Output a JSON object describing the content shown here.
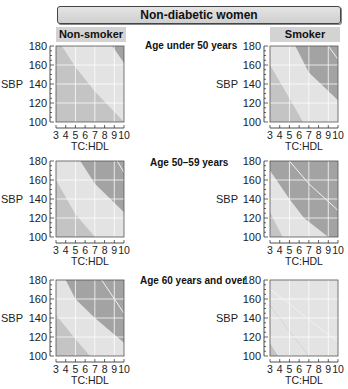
{
  "title": "Non-diabetic women",
  "columns": [
    {
      "label": "Non-smoker"
    },
    {
      "label": "Smoker"
    }
  ],
  "rows": [
    {
      "label": "Age under 50 years"
    },
    {
      "label": "Age  50–59 years"
    },
    {
      "label": "Age 60 years and over"
    }
  ],
  "axes": {
    "ylabel": "SBP",
    "xlabel": "TC:HDL",
    "yticks": [
      "180",
      "160",
      "140",
      "120",
      "100"
    ],
    "xticks": [
      "3",
      "4",
      "5",
      "6",
      "7",
      "8",
      "9",
      "10"
    ]
  },
  "colors": {
    "light": "#e3e3e3",
    "medium": "#c4c4c4",
    "dark": "#a3a3a3",
    "line": "#f2f2f2",
    "tag": "#d3d3d3"
  },
  "chart_data": [
    {
      "type": "area",
      "title": "Non-smoker, Age under 50 years",
      "xlabel": "TC:HDL",
      "ylabel": "SBP",
      "xlim": [
        3,
        10
      ],
      "ylim": [
        100,
        180
      ],
      "zones": [
        {
          "name": "medium",
          "region": "left of curve"
        },
        {
          "name": "light",
          "boundary": [
            [
              3.6,
              180
            ],
            [
              5,
              158
            ],
            [
              7,
              132
            ],
            [
              10,
              100
            ]
          ]
        },
        {
          "name": "dark",
          "boundary": [
            [
              8.8,
              180
            ],
            [
              10,
              162
            ]
          ]
        }
      ]
    },
    {
      "type": "area",
      "title": "Smoker, Age under 50 years",
      "xlabel": "TC:HDL",
      "ylabel": "SBP",
      "xlim": [
        3,
        10
      ],
      "ylim": [
        100,
        180
      ],
      "zones": [
        {
          "name": "medium",
          "region": "lower-left"
        },
        {
          "name": "light",
          "boundary": [
            [
              3,
              160
            ],
            [
              5,
              125
            ],
            [
              6.4,
              100
            ]
          ]
        },
        {
          "name": "dark",
          "boundary": [
            [
              5.6,
              180
            ],
            [
              7,
              152
            ],
            [
              10,
              123
            ]
          ]
        },
        {
          "name": "line",
          "boundary": [
            [
              9,
              180
            ],
            [
              10,
              166
            ]
          ]
        }
      ]
    },
    {
      "type": "area",
      "title": "Non-smoker, Age 50–59 years",
      "xlabel": "TC:HDL",
      "ylabel": "SBP",
      "xlim": [
        3,
        10
      ],
      "ylim": [
        100,
        180
      ],
      "zones": [
        {
          "name": "medium",
          "region": "lower-left"
        },
        {
          "name": "light",
          "boundary": [
            [
              3,
              160
            ],
            [
              5,
              124
            ],
            [
              7,
              100
            ]
          ]
        },
        {
          "name": "dark",
          "boundary": [
            [
              5.5,
              180
            ],
            [
              7,
              156
            ],
            [
              10,
              126
            ]
          ]
        },
        {
          "name": "line",
          "boundary": [
            [
              9.3,
              180
            ],
            [
              10,
              168
            ]
          ]
        }
      ]
    },
    {
      "type": "area",
      "title": "Smoker, Age 50–59 years",
      "xlabel": "TC:HDL",
      "ylabel": "SBP",
      "xlim": [
        3,
        10
      ],
      "ylim": [
        100,
        180
      ],
      "zones": [
        {
          "name": "medium",
          "region": "lower-left corner"
        },
        {
          "name": "light",
          "boundary": [
            [
              3,
              126
            ],
            [
              4.3,
              100
            ]
          ]
        },
        {
          "name": "dark",
          "boundary": [
            [
              3,
              170
            ],
            [
              5,
              140
            ],
            [
              6.5,
              120
            ],
            [
              9,
              100
            ]
          ]
        },
        {
          "name": "line",
          "boundary": [
            [
              5,
              180
            ],
            [
              7,
              156
            ],
            [
              10,
              128
            ]
          ]
        }
      ]
    },
    {
      "type": "area",
      "title": "Non-smoker, Age 60 years and over",
      "xlabel": "TC:HDL",
      "ylabel": "SBP",
      "xlim": [
        3,
        10
      ],
      "ylim": [
        100,
        180
      ],
      "zones": [
        {
          "name": "medium",
          "region": "lower-left"
        },
        {
          "name": "light",
          "boundary": [
            [
              3,
              143
            ],
            [
              5,
              118
            ],
            [
              6.5,
              100
            ]
          ]
        },
        {
          "name": "dark",
          "boundary": [
            [
              4,
              180
            ],
            [
              5,
              160
            ],
            [
              7,
              140
            ],
            [
              10,
              114
            ]
          ]
        },
        {
          "name": "line",
          "boundary": [
            [
              7.7,
              180
            ],
            [
              10,
              145
            ]
          ]
        }
      ]
    },
    {
      "type": "area",
      "title": "Smoker, Age 60 years and over",
      "xlabel": "TC:HDL",
      "ylabel": "SBP",
      "xlim": [
        3,
        10
      ],
      "ylim": [
        100,
        180
      ],
      "zones": [
        {
          "name": "medium",
          "region": "lower-left corner"
        },
        {
          "name": "light",
          "boundary": [
            [
              3,
              153
            ],
            [
              5,
              126
            ],
            [
              7,
              100
            ]
          ]
        },
        {
          "name": "dark",
          "region": "rest"
        },
        {
          "name": "line",
          "boundary": [
            [
              3,
              170
            ],
            [
              5,
              155
            ],
            [
              7,
              138
            ],
            [
              10,
              115
            ]
          ]
        }
      ]
    }
  ]
}
